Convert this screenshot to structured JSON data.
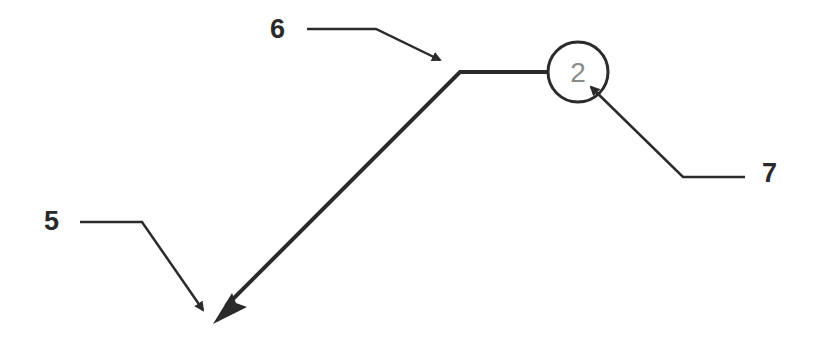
{
  "diagram": {
    "type": "technical-drawing-callouts",
    "balloon": {
      "number": "2",
      "center": [
        578,
        72
      ],
      "radius": 30
    },
    "main_leader": {
      "points": [
        [
          548,
          72
        ],
        [
          460,
          72
        ],
        [
          222,
          310
        ]
      ],
      "arrow_tip": [
        215,
        322
      ]
    },
    "callouts": [
      {
        "label": "6",
        "label_pos": [
          272,
          38
        ],
        "leader_points": [
          [
            307,
            29
          ],
          [
            376,
            29
          ],
          [
            438,
            58
          ]
        ],
        "arrow_tip": [
          447,
          64
        ],
        "target": "leader knee"
      },
      {
        "label": "5",
        "label_pos": [
          45,
          230
        ],
        "leader_points": [
          [
            80,
            222
          ],
          [
            142,
            222
          ],
          [
            200,
            305
          ]
        ],
        "arrow_tip": [
          207,
          316
        ],
        "target": "leader arrowhead"
      },
      {
        "label": "7",
        "label_pos": [
          762,
          182
        ],
        "leader_points": [
          [
            745,
            177
          ],
          [
            683,
            177
          ],
          [
            595,
            92
          ]
        ],
        "arrow_tip": [
          586,
          83
        ],
        "target": "balloon number"
      }
    ],
    "colors": {
      "line": "#2b2b2b",
      "balloon_text": "#8a8a8a",
      "background": "#ffffff"
    }
  }
}
